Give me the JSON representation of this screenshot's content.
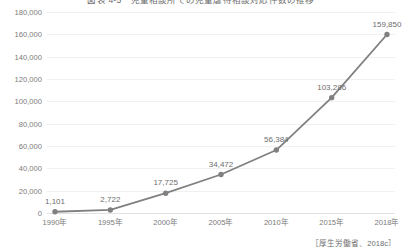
{
  "chart_data": {
    "type": "line",
    "title": "図表 4-5　児童相談所での児童虐待相談対応件数の推移",
    "xlabel": "",
    "ylabel": "",
    "categories": [
      "1990年",
      "1995年",
      "2000年",
      "2005年",
      "2010年",
      "2015年",
      "2018年"
    ],
    "values": [
      1101,
      2722,
      17725,
      34472,
      56384,
      103286,
      159850
    ],
    "value_labels": [
      "1,101",
      "2,722",
      "17,725",
      "34,472",
      "56,384",
      "103,286",
      "159,850"
    ],
    "ylim": [
      0,
      180000
    ],
    "ytick_values": [
      0,
      20000,
      40000,
      60000,
      80000,
      100000,
      120000,
      140000,
      160000,
      180000
    ],
    "ytick_labels": [
      "0",
      "20,000",
      "40,000",
      "60,000",
      "80,000",
      "100,000",
      "120,000",
      "140,000",
      "160,000",
      "180,000"
    ],
    "grid": true,
    "legend": false,
    "series_color": "#808080",
    "marker": "circle",
    "marker_color": "#808080",
    "grid_color": "#f0f0f0",
    "axis_color": "#e2e2e2",
    "text_color": "#7a7a7a"
  },
  "source_note": "［厚生労働省、2018c］"
}
